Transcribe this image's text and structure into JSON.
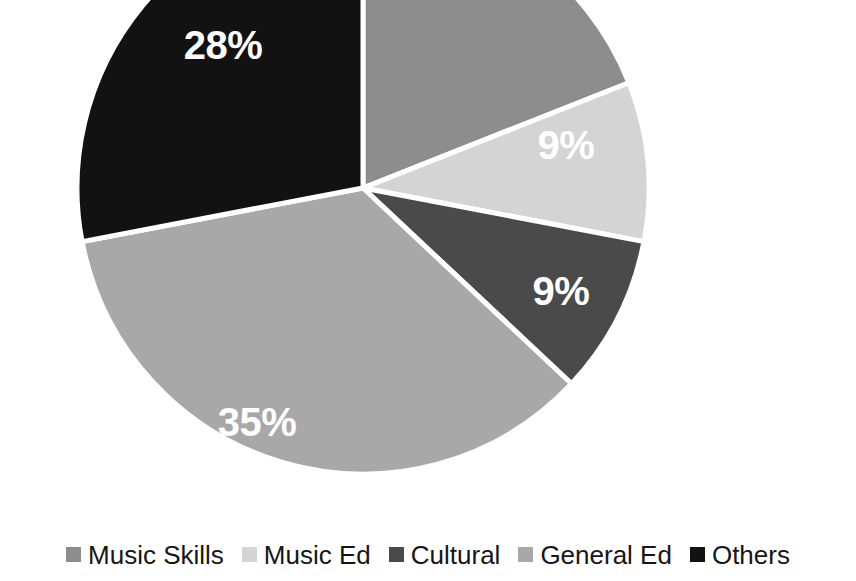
{
  "chart_data": {
    "type": "pie",
    "title": "",
    "categories": [
      "Music Skills",
      "Music Ed",
      "Cultural",
      "General Ed",
      "Others"
    ],
    "values": [
      19,
      9,
      9,
      35,
      28
    ],
    "unit": "%",
    "labels_shown": [
      "",
      "9%",
      "9%",
      "35%",
      "28%"
    ],
    "colors": [
      "#8d8d8d",
      "#d4d4d4",
      "#4a4a4a",
      "#a8a8a8",
      "#121212"
    ],
    "legend_position": "bottom",
    "grid": false,
    "start_angle_deg": 0,
    "direction": "clockwise",
    "note_top_cropped": true
  },
  "chart": {
    "center_x": 363,
    "center_y": 188,
    "radius": 286,
    "slice_border_color": "#ffffff",
    "slice_border_width": 5,
    "background": "#ffffff",
    "label_color": "#ffffff"
  },
  "slice_labels": [
    {
      "text": "28%",
      "x": 223,
      "y": 48
    },
    {
      "text": "9%",
      "x": 566,
      "y": 148
    },
    {
      "text": "9%",
      "x": 561,
      "y": 294
    },
    {
      "text": "35%",
      "x": 257,
      "y": 425
    }
  ],
  "legend": {
    "items": [
      {
        "label": "Music Skills",
        "color": "#8d8d8d"
      },
      {
        "label": "Music Ed",
        "color": "#d4d4d4"
      },
      {
        "label": "Cultural",
        "color": "#4a4a4a"
      },
      {
        "label": "General Ed",
        "color": "#a8a8a8"
      },
      {
        "label": "Others",
        "color": "#121212"
      }
    ]
  }
}
